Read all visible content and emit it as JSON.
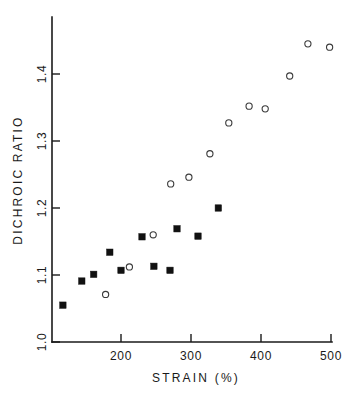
{
  "chart_data": {
    "type": "scatter",
    "title": "",
    "xlabel": "STRAIN (%)",
    "ylabel": "DICHROIC RATIO",
    "xlim": [
      101,
      500
    ],
    "ylim": [
      1.0,
      1.44
    ],
    "xticks": [
      200,
      300,
      400,
      500
    ],
    "xtick_labels": [
      "200",
      "300",
      "400",
      "500"
    ],
    "yticks": [
      1.0,
      1.1,
      1.2,
      1.3,
      1.4
    ],
    "ytick_labels": [
      "1.0",
      "1.1",
      "1.2",
      "1.3",
      "1.4"
    ],
    "grid": false,
    "legend": "none",
    "series": [
      {
        "name": "open-circles",
        "marker": "open-circle",
        "color": "#3a3a3a",
        "points": [
          {
            "x": 178,
            "y": 1.071
          },
          {
            "x": 212,
            "y": 1.112
          },
          {
            "x": 246,
            "y": 1.16
          },
          {
            "x": 271,
            "y": 1.236
          },
          {
            "x": 297,
            "y": 1.246
          },
          {
            "x": 327,
            "y": 1.281
          },
          {
            "x": 354,
            "y": 1.327
          },
          {
            "x": 383,
            "y": 1.352
          },
          {
            "x": 406,
            "y": 1.348
          },
          {
            "x": 441,
            "y": 1.397
          },
          {
            "x": 467,
            "y": 1.445
          },
          {
            "x": 498,
            "y": 1.44
          }
        ]
      },
      {
        "name": "filled-squares",
        "marker": "filled-square",
        "color": "#111111",
        "points": [
          {
            "x": 117,
            "y": 1.055
          },
          {
            "x": 144,
            "y": 1.091
          },
          {
            "x": 161,
            "y": 1.101
          },
          {
            "x": 184,
            "y": 1.134
          },
          {
            "x": 200,
            "y": 1.107
          },
          {
            "x": 230,
            "y": 1.157
          },
          {
            "x": 247,
            "y": 1.113
          },
          {
            "x": 270,
            "y": 1.107
          },
          {
            "x": 280,
            "y": 1.169
          },
          {
            "x": 310,
            "y": 1.158
          },
          {
            "x": 339,
            "y": 1.2
          }
        ]
      }
    ]
  },
  "figure": {
    "background_color": "#ffffff",
    "axis_color": "#1a1a1a"
  }
}
